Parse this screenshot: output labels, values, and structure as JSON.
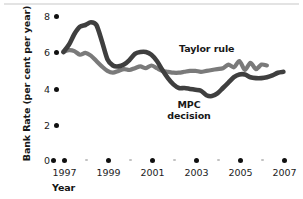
{
  "chart_data": {
    "type": "line",
    "title": "",
    "xlabel": "Year",
    "ylabel": "Bank Rate (per cent per year)",
    "xlim": [
      1996.6,
      2007.4
    ],
    "ylim": [
      0,
      8.6
    ],
    "grid": false,
    "legend_position": "inline-annotations",
    "y_ticks": [
      {
        "value": 8,
        "label": "8"
      },
      {
        "value": 6,
        "label": "6"
      },
      {
        "value": 4,
        "label": "4"
      },
      {
        "value": 2,
        "label": "2"
      },
      {
        "value": 0,
        "label": "0"
      }
    ],
    "x_ticks_major": [
      {
        "value": 1997,
        "label": "1997"
      },
      {
        "value": 1999,
        "label": "1999"
      },
      {
        "value": 2001,
        "label": "2001"
      },
      {
        "value": 2003,
        "label": "2003"
      },
      {
        "value": 2005,
        "label": "2005"
      },
      {
        "value": 2007,
        "label": "2007"
      }
    ],
    "x_ticks_minor": [
      {
        "value": 1998,
        "label": ""
      },
      {
        "value": 2000,
        "label": ""
      },
      {
        "value": 2002,
        "label": ""
      },
      {
        "value": 2004,
        "label": ""
      },
      {
        "value": 2006,
        "label": ""
      }
    ],
    "origin_marker": {
      "value": 0,
      "label": ""
    },
    "series": [
      {
        "name": "Taylor rule",
        "color": "#7a7a7a",
        "annotation": "Taylor rule",
        "x": [
          1996.95,
          1997.2,
          1997.45,
          1997.7,
          1997.95,
          1998.2,
          1998.45,
          1998.7,
          1998.95,
          1999.2,
          1999.45,
          1999.7,
          1999.95,
          2000.2,
          2000.45,
          2000.7,
          2000.95,
          2001.2,
          2001.45,
          2001.7,
          2001.95,
          2002.2,
          2002.45,
          2002.7,
          2002.95,
          2003.2,
          2003.45,
          2003.7,
          2003.95,
          2004.2,
          2004.45,
          2004.7,
          2004.95,
          2005.2,
          2005.45,
          2005.7,
          2005.95,
          2006.2
        ],
        "values": [
          6.0,
          6.1,
          6.05,
          5.85,
          5.95,
          5.8,
          5.5,
          5.2,
          4.95,
          4.85,
          4.95,
          5.05,
          5.0,
          5.1,
          5.2,
          5.1,
          5.25,
          5.1,
          4.95,
          4.9,
          4.85,
          4.85,
          4.9,
          4.95,
          4.95,
          4.9,
          4.95,
          5.0,
          5.05,
          5.1,
          5.3,
          5.15,
          5.5,
          5.0,
          5.4,
          5.05,
          5.3,
          5.25
        ]
      },
      {
        "name": "MPC decision",
        "color": "#3f3f3f",
        "annotation": "MPC\ndecision",
        "x": [
          1996.95,
          1997.2,
          1997.45,
          1997.7,
          1997.95,
          1998.2,
          1998.45,
          1998.7,
          1998.95,
          1999.2,
          1999.45,
          1999.7,
          1999.95,
          2000.2,
          2000.45,
          2000.7,
          2000.95,
          2001.2,
          2001.45,
          2001.7,
          2001.95,
          2002.2,
          2002.45,
          2002.7,
          2002.95,
          2003.2,
          2003.45,
          2003.7,
          2003.95,
          2004.2,
          2004.45,
          2004.7,
          2004.95,
          2005.2,
          2005.45,
          2005.7,
          2005.95,
          2006.2,
          2006.45,
          2006.7,
          2006.95
        ],
        "values": [
          6.0,
          6.4,
          7.0,
          7.4,
          7.5,
          7.65,
          7.5,
          6.6,
          5.6,
          5.25,
          5.2,
          5.3,
          5.55,
          5.9,
          6.0,
          6.0,
          5.85,
          5.5,
          5.0,
          4.55,
          4.2,
          4.0,
          4.0,
          3.95,
          3.9,
          3.85,
          3.6,
          3.55,
          3.7,
          4.0,
          4.3,
          4.6,
          4.75,
          4.75,
          4.6,
          4.55,
          4.55,
          4.6,
          4.7,
          4.85,
          4.9
        ]
      }
    ],
    "annotations": [
      {
        "text": "Taylor rule",
        "x": 2003.3,
        "y": 6.0
      },
      {
        "text": "MPC",
        "x": 2002.0,
        "y": 3.0
      },
      {
        "text": "decision",
        "x": 2002.0,
        "y": 2.55
      }
    ]
  }
}
